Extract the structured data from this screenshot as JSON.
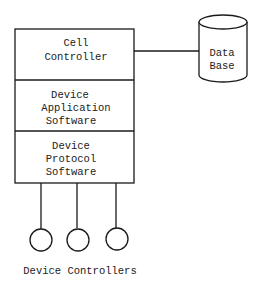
{
  "diagram": {
    "stack": {
      "layers": [
        {
          "lines": [
            "Cell",
            "Controller"
          ]
        },
        {
          "lines": [
            "Device",
            "Application",
            "Software"
          ]
        },
        {
          "lines": [
            "Device",
            "Protocol",
            "Software"
          ]
        }
      ]
    },
    "database": {
      "lines": [
        "Data",
        "Base"
      ]
    },
    "devices": {
      "count": 3,
      "label": "Device Controllers"
    },
    "colors": {
      "stroke": "#1a1a1a",
      "background": "#ffffff"
    }
  }
}
